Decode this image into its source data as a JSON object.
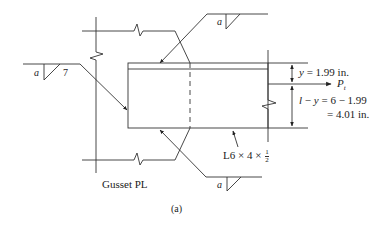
{
  "figure": {
    "caption": "(a)",
    "gusset_label": "Gusset PL",
    "angle_label": "L6 × 4 × ",
    "angle_fraction": {
      "num": "1",
      "den": "2"
    },
    "weld_symbols": [
      {
        "position": "top",
        "size": "a"
      },
      {
        "position": "left",
        "size": "a",
        "length": "7"
      },
      {
        "position": "bottom",
        "size": "a"
      }
    ],
    "dimensions": {
      "y_label": "y",
      "y_value": "= 1.99 in.",
      "force_label": "P",
      "force_sub": "t",
      "remainder_line1_prefix": "l",
      "remainder_line1_mid": " − ",
      "remainder_line1_y": "y",
      "remainder_line1_value": " = 6 − 1.99",
      "remainder_line2": "= 4.01 in."
    },
    "colors": {
      "line": "#333333",
      "background": "#ffffff"
    }
  }
}
